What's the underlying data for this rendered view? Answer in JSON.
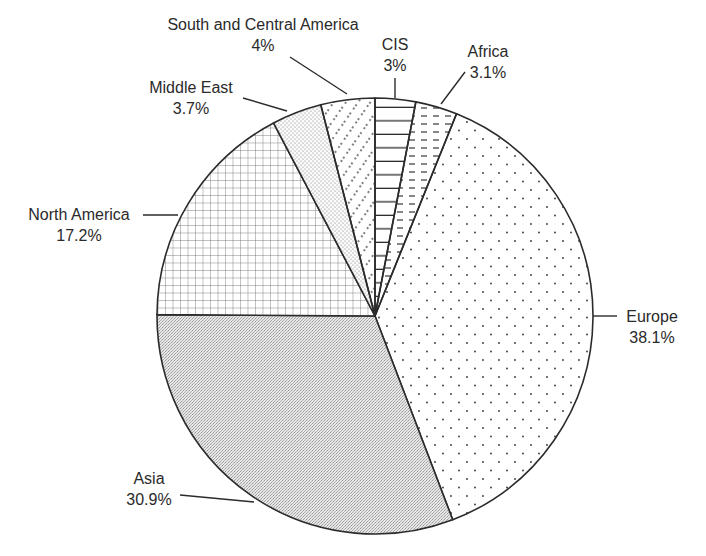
{
  "chart_data": {
    "type": "pie",
    "title": "",
    "start_angle_deg": 0,
    "direction": "clockwise",
    "center": [
      375,
      316
    ],
    "radius": 218,
    "slices": [
      {
        "label": "CIS",
        "value": 3.0,
        "display": "3%",
        "pattern": "hlines"
      },
      {
        "label": "Africa",
        "value": 3.1,
        "display": "3.1%",
        "pattern": "dashes"
      },
      {
        "label": "Europe",
        "value": 38.1,
        "display": "38.1%",
        "pattern": "sparse-dots"
      },
      {
        "label": "Asia",
        "value": 30.9,
        "display": "30.9%",
        "pattern": "gray-stipple"
      },
      {
        "label": "North America",
        "value": 17.2,
        "display": "17.2%",
        "pattern": "grid"
      },
      {
        "label": "Middle East",
        "value": 3.7,
        "display": "3.7%",
        "pattern": "fine-dots"
      },
      {
        "label": "South and Central America",
        "value": 4.0,
        "display": "4%",
        "pattern": "diagonal-dots"
      }
    ],
    "legend": "none (direct labels with leader lines)"
  },
  "labels": {
    "cis": {
      "name": "CIS",
      "value": "3%"
    },
    "africa": {
      "name": "Africa",
      "value": "3.1%"
    },
    "europe": {
      "name": "Europe",
      "value": "38.1%"
    },
    "asia": {
      "name": "Asia",
      "value": "30.9%"
    },
    "north_america": {
      "name": "North America",
      "value": "17.2%"
    },
    "middle_east": {
      "name": "Middle East",
      "value": "3.7%"
    },
    "south_central_america": {
      "name": "South and Central America",
      "value": "4%"
    }
  },
  "colors": {
    "stroke": "#2b2b2b",
    "asia_fill": "#d6d6d6",
    "background": "#ffffff"
  }
}
